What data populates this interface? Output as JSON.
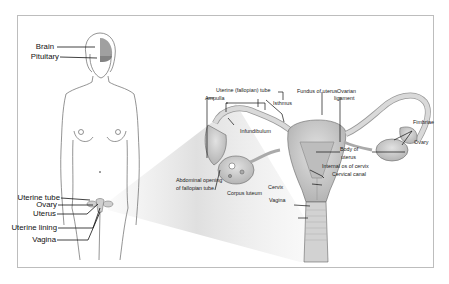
{
  "figure": {
    "type": "anatomical-diagram",
    "colors": {
      "frame_border": "#bdbdbd",
      "outline": "#555555",
      "organ_fill": "#c9c9c9",
      "brain_fill": "#9a9a9a",
      "label_text": "#222222",
      "leader_line": "#111111"
    },
    "body_labels": {
      "brain": "Brain",
      "pituitary": "Pituitary",
      "uterine_tube": "Uterine tube",
      "ovary": "Ovary",
      "uterus": "Uterus",
      "uterine_lining": "Uterine lining",
      "vagina": "Vagina"
    },
    "detail_labels": {
      "uterine_fallopian_tube": "Uterine (fallopian) tube",
      "ampulla": "Ampulla",
      "isthmus": "Isthmus",
      "fundus_of_uterus": "Fundus of uterus",
      "ovarian_ligament_1": "Ovarian",
      "ovarian_ligament_2": "ligament",
      "fimbriae": "Fimbriae",
      "ovary": "Ovary",
      "infundibulum": "Infundibulum",
      "body_of_uterus_1": "Body of",
      "body_of_uterus_2": "uterus",
      "internal_os_of_cervix": "Internal os of cervix",
      "cervical_canal": "Cervical canal",
      "abdominal_opening_1": "Abdominal opening",
      "abdominal_opening_2": "of fallopian tube",
      "corpus_luteum": "Corpus luteum",
      "cervix": "Cervix",
      "vagina": "Vagina"
    }
  }
}
